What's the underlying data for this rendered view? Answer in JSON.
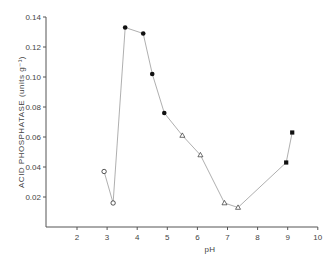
{
  "chart_data": {
    "type": "scatter",
    "title": "",
    "xlabel": "pH",
    "ylabel": "ACID PHOSPHATASE (units g⁻¹)",
    "xlim": [
      1,
      10
    ],
    "ylim": [
      0,
      0.14
    ],
    "x_ticks": [
      "2",
      "3",
      "4",
      "5",
      "6",
      "7",
      "8",
      "9",
      "10"
    ],
    "y_ticks": [
      "0.02",
      "0.04",
      "0.06",
      "0.08",
      "0.10",
      "0.12",
      "0.14"
    ],
    "grid": false,
    "legend": null,
    "series": [
      {
        "name": "buffer A (open circles)",
        "marker": "open-circle",
        "points": [
          [
            2.9,
            0.037
          ],
          [
            3.2,
            0.016
          ]
        ]
      },
      {
        "name": "buffer B (filled circles)",
        "marker": "filled-circle",
        "points": [
          [
            3.6,
            0.133
          ],
          [
            4.2,
            0.129
          ],
          [
            4.5,
            0.102
          ],
          [
            4.9,
            0.076
          ]
        ]
      },
      {
        "name": "buffer C (open triangles)",
        "marker": "open-triangle",
        "points": [
          [
            5.5,
            0.061
          ],
          [
            6.1,
            0.048
          ],
          [
            6.9,
            0.016
          ],
          [
            7.35,
            0.013
          ]
        ]
      },
      {
        "name": "buffer D (filled squares)",
        "marker": "filled-square",
        "points": [
          [
            8.95,
            0.043
          ],
          [
            9.15,
            0.063
          ]
        ]
      }
    ],
    "connected_line_order": [
      [
        2.9,
        0.037
      ],
      [
        3.2,
        0.016
      ],
      [
        3.6,
        0.133
      ],
      [
        4.2,
        0.129
      ],
      [
        4.5,
        0.102
      ],
      [
        4.9,
        0.076
      ],
      [
        5.5,
        0.061
      ],
      [
        6.1,
        0.048
      ],
      [
        6.9,
        0.016
      ],
      [
        7.35,
        0.013
      ],
      [
        8.95,
        0.043
      ],
      [
        9.15,
        0.063
      ]
    ]
  },
  "colors": {
    "axis": "#555555",
    "line": "#9a9a9a",
    "marker": "#111111"
  }
}
